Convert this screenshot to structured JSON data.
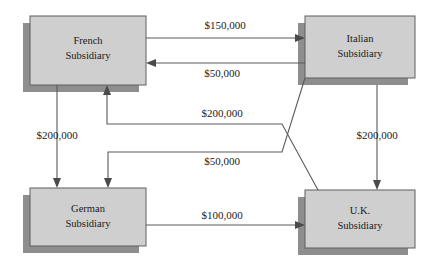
{
  "diagram": {
    "type": "flow-diagram",
    "canvas": {
      "width": 428,
      "height": 271,
      "background": "#ffffff"
    },
    "style": {
      "box_fill": "#cfcfcf",
      "box_border": "#5f5f5f",
      "box_shadow": "#8e8e8e",
      "line_color": "#5a5a5a",
      "text_color": "#1a1a1a"
    },
    "nodes": [
      {
        "id": "french",
        "line1": "French",
        "line2": "Subsidiary",
        "x": 30,
        "y": 16,
        "w": 116,
        "h": 69
      },
      {
        "id": "italian",
        "line1": "Italian",
        "line2": "Subsidiary",
        "x": 305,
        "y": 16,
        "w": 110,
        "h": 62
      },
      {
        "id": "german",
        "line1": "German",
        "line2": "Subsidiary",
        "x": 30,
        "y": 188,
        "w": 116,
        "h": 58
      },
      {
        "id": "uk",
        "line1": "U.K.",
        "line2": "Subsidiary",
        "x": 305,
        "y": 190,
        "w": 110,
        "h": 58
      }
    ],
    "edges": [
      {
        "id": "french-to-italian",
        "amount": "$150,000",
        "from": "french",
        "to": "italian",
        "label_x": 225,
        "label_y": 26
      },
      {
        "id": "italian-to-french",
        "amount": "$50,000",
        "from": "italian",
        "to": "french",
        "label_x": 222,
        "label_y": 74
      },
      {
        "id": "french-to-german",
        "amount": "$200,000",
        "from": "french",
        "to": "german",
        "label_x": 57,
        "label_y": 136
      },
      {
        "id": "uk-to-french",
        "amount": "$200,000",
        "from": "uk",
        "to": "french",
        "label_x": 222,
        "label_y": 114
      },
      {
        "id": "italian-to-german",
        "amount": "$50,000",
        "from": "italian",
        "to": "german",
        "label_x": 222,
        "label_y": 162
      },
      {
        "id": "italian-to-uk",
        "amount": "$200,000",
        "from": "italian",
        "to": "uk",
        "label_x": 377,
        "label_y": 136
      },
      {
        "id": "german-to-uk",
        "amount": "$100,000",
        "from": "german",
        "to": "uk",
        "label_x": 222,
        "label_y": 216
      }
    ]
  }
}
